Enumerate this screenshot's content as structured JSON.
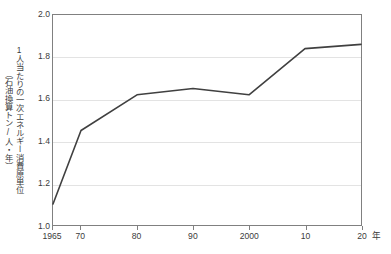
{
  "chart_data": {
    "type": "line",
    "title": "",
    "xlabel": "年",
    "ylabel": "1人当たりの一次エネルギー消費原単位（石油換算トン/人・年）",
    "ylabel_line1": "1人当たりの一次エネルギー消費原単位",
    "ylabel_line2": "（石油換算トン/人・年）",
    "x": [
      1965,
      1970,
      1980,
      1990,
      2000,
      2010,
      2020
    ],
    "values": [
      1.1,
      1.45,
      1.62,
      1.65,
      1.62,
      1.84,
      1.86
    ],
    "categories": [
      "1965",
      "70",
      "80",
      "90",
      "2000",
      "10",
      "20"
    ],
    "xtick_labels": [
      "1965",
      "70",
      "80",
      "90",
      "2000",
      "10",
      "20"
    ],
    "ytick_labels": [
      "2.0",
      "1.8",
      "1.6",
      "1.4",
      "1.2",
      "1.0"
    ],
    "ytick_values": [
      2.0,
      1.8,
      1.6,
      1.4,
      1.2,
      1.0
    ],
    "xlim": [
      1965,
      2020
    ],
    "ylim": [
      1.0,
      2.0
    ],
    "grid": "horizontal",
    "legend": "none",
    "series": [
      {
        "name": "1人当たりの一次エネルギー消費原単位",
        "values": [
          1.1,
          1.45,
          1.62,
          1.65,
          1.62,
          1.84,
          1.86
        ]
      }
    ],
    "colors": {
      "line": "#404040",
      "grid": "#e3e3e3",
      "axis": "#808080",
      "text": "#3b3b3b",
      "background": "#ffffff"
    }
  },
  "axis": {
    "x_unit_label": "年"
  }
}
